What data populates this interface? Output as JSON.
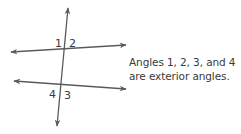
{
  "diagram": {
    "colors": {
      "line": "#5a5a5a",
      "text": "#3a3a3a",
      "background": "#ffffff"
    },
    "lines": {
      "transversal": {
        "x1": 68,
        "y1": 8,
        "x2": 57,
        "y2": 126
      },
      "top_line": {
        "x1": 11,
        "y1": 52,
        "x2": 126,
        "y2": 45
      },
      "bottom_line": {
        "x1": 14,
        "y1": 81,
        "x2": 126,
        "y2": 89
      }
    },
    "angle_labels": [
      {
        "id": "1",
        "text": "1",
        "x": 55,
        "y": 47
      },
      {
        "id": "2",
        "text": "2",
        "x": 69,
        "y": 47
      },
      {
        "id": "4",
        "text": "4",
        "x": 49,
        "y": 98
      },
      {
        "id": "3",
        "text": "3",
        "x": 64,
        "y": 99
      }
    ],
    "caption": {
      "line1": "Angles 1, 2, 3, and 4",
      "line2": "are exterior angles."
    }
  }
}
